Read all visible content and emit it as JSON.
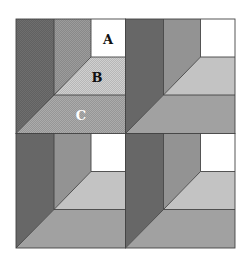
{
  "figure": {
    "labels": {
      "a": "A",
      "b": "B",
      "c": "C"
    },
    "colors": {
      "background": "#ffffff",
      "dark": "#6e6e6e",
      "medium": "#9c9c9c",
      "white": "#ffffff",
      "light": "#d0d0d0",
      "mid_light": "#ababab",
      "outline": "#444444",
      "label_dark": "#111111",
      "label_light": "#ffffff"
    },
    "tiles": [
      {
        "id": "top-left",
        "row": 0,
        "col": 0,
        "labeled": true
      },
      {
        "id": "top-right",
        "row": 0,
        "col": 1,
        "labeled": false
      },
      {
        "id": "bottom-left",
        "row": 1,
        "col": 0,
        "labeled": false
      },
      {
        "id": "bottom-right",
        "row": 1,
        "col": 1,
        "labeled": false
      }
    ]
  }
}
